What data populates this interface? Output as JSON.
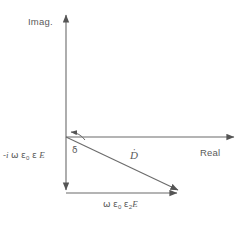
{
  "figure": {
    "type": "phasor-diagram",
    "background_color": "#ffffff",
    "line_color": "#6b6b6b",
    "text_color": "#5a5a5a"
  },
  "axes": {
    "imaginary": {
      "label": "Imag.",
      "orientation": "vertical",
      "arrow_direction": "up"
    },
    "real": {
      "label": "Real",
      "orientation": "horizontal",
      "arrow_direction": "right"
    }
  },
  "vectors": [
    {
      "name": "displacement-current-vector",
      "label": "D",
      "label_accent": "overdot",
      "label_full": "Ḋ",
      "description": "resultant phasor from origin to lower right"
    },
    {
      "name": "imaginary-component-vector",
      "label_parts": {
        "prefix": "-i",
        "omega": "ω",
        "eps0": "ε",
        "eps0_sub": "0",
        "eps": "ε",
        "field": "E"
      },
      "label_full": "-i ω ε₀ ε E",
      "description": "downward vertical component along imaginary axis"
    },
    {
      "name": "real-component-vector",
      "label_parts": {
        "omega": "ω",
        "eps0": "ε",
        "eps0_sub": "0",
        "eps2": "ε",
        "eps2_sub": "2",
        "field": "E"
      },
      "label_full": "ω ε₀ ε₂E",
      "description": "horizontal component along bottom"
    }
  ],
  "angle": {
    "name": "loss-angle",
    "symbol": "δ",
    "description": "angle between real axis and D vector measured at origin"
  }
}
